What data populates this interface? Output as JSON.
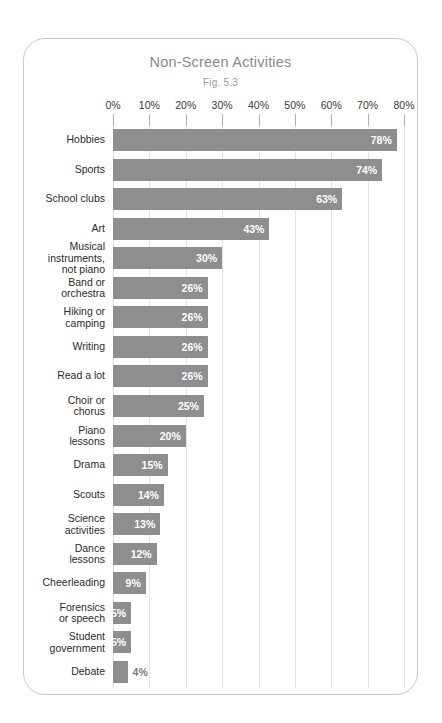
{
  "chart_data": {
    "type": "bar",
    "orientation": "horizontal",
    "title": "Non-Screen Activities",
    "subtitle": "Fig. 5.3",
    "xlabel": "",
    "ylabel": "",
    "xlim": [
      0,
      80
    ],
    "xticks": [
      "0%",
      "10%",
      "20%",
      "30%",
      "40%",
      "50%",
      "60%",
      "70%",
      "80%"
    ],
    "xtick_values": [
      0,
      10,
      20,
      30,
      40,
      50,
      60,
      70,
      80
    ],
    "grid": "vertical",
    "legend": "none",
    "bar_color": "#8e8e8e",
    "value_label_inside_color": "#ffffff",
    "value_label_outside_color": "#7d7d7d",
    "categories": [
      "Hobbies",
      "Sports",
      "School clubs",
      "Art",
      "Musical\ninstruments,\nnot piano",
      "Band or\norchestra",
      "Hiking or\ncamping",
      "Writing",
      "Read a lot",
      "Choir or\nchorus",
      "Piano\nlessons",
      "Drama",
      "Scouts",
      "Science\nactivities",
      "Dance\nlessons",
      "Cheerleading",
      "Forensics\nor speech",
      "Student\ngovernment",
      "Debate"
    ],
    "values": [
      78,
      74,
      63,
      43,
      30,
      26,
      26,
      26,
      26,
      25,
      20,
      15,
      14,
      13,
      12,
      9,
      5,
      5,
      4
    ],
    "value_labels": [
      "78%",
      "74%",
      "63%",
      "43%",
      "30%",
      "26%",
      "26%",
      "26%",
      "26%",
      "25%",
      "20%",
      "15%",
      "14%",
      "13%",
      "12%",
      "9%",
      "5%",
      "5%",
      "4%"
    ],
    "label_placement": [
      "inside",
      "inside",
      "inside",
      "inside",
      "inside",
      "inside",
      "inside",
      "inside",
      "inside",
      "inside",
      "inside",
      "inside",
      "inside",
      "inside",
      "inside",
      "inside",
      "inside",
      "inside",
      "outside"
    ]
  }
}
